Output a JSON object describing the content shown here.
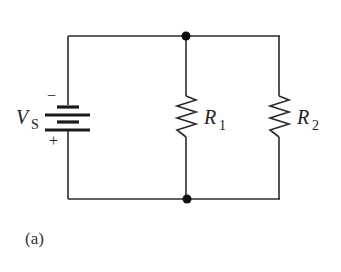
{
  "diagram": {
    "type": "parallel-resistor-circuit",
    "source": {
      "label": "V",
      "subscript": "S",
      "neg_sign": "−",
      "pos_sign": "+"
    },
    "resistors": [
      {
        "label": "R",
        "subscript": "1"
      },
      {
        "label": "R",
        "subscript": "2"
      }
    ],
    "caption": "(a)",
    "colors": {
      "wire": "#2a2a2a",
      "node": "#111111",
      "text": "#222222"
    }
  }
}
